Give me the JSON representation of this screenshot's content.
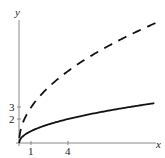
{
  "chart_data": {
    "type": "line",
    "title": "",
    "xlabel": "x",
    "ylabel": "y",
    "x_ticks": [
      1,
      4
    ],
    "y_ticks": [
      2,
      3
    ],
    "xlim": [
      0,
      11.5
    ],
    "ylim": [
      0,
      11
    ],
    "grid": false,
    "legend": null,
    "series": [
      {
        "name": "solid curve",
        "style": "solid",
        "formula": "y = sqrt(x)",
        "x": [
          0,
          1,
          4,
          9,
          11
        ],
        "values": [
          0,
          1,
          2,
          3,
          3.32
        ]
      },
      {
        "name": "dashed curve",
        "style": "dashed",
        "formula": "y = 3*sqrt(x)",
        "x": [
          0.5,
          1,
          4,
          9,
          11
        ],
        "values": [
          2.12,
          3,
          6,
          9,
          9.95
        ]
      }
    ]
  },
  "labels": {
    "x_axis": "x",
    "y_axis": "y",
    "xtick_1": "1",
    "xtick_4": "4",
    "ytick_2": "2",
    "ytick_3": "3"
  }
}
